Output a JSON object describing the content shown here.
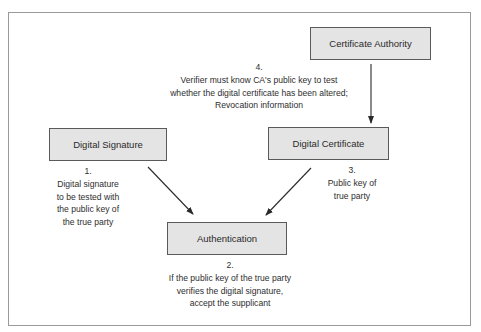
{
  "nodes": {
    "ca": {
      "label": "Certificate Authority"
    },
    "signature": {
      "label": "Digital Signature"
    },
    "certificate": {
      "label": "Digital Certificate"
    },
    "authentication": {
      "label": "Authentication"
    }
  },
  "notes": {
    "n1": {
      "num": "1.",
      "lines": [
        "Digital signature",
        "to be tested with",
        "the public key of",
        "the true party"
      ]
    },
    "n2": {
      "num": "2.",
      "lines": [
        "If the public key of the true party",
        "verifies the digital signature,",
        "accept the supplicant"
      ]
    },
    "n3": {
      "num": "3.",
      "lines": [
        "Public key of",
        "true party"
      ]
    },
    "n4": {
      "num": "4.",
      "lines": [
        "Verifier must know CA's public key to test",
        "whether the digital certificate has been altered;",
        "Revocation information"
      ]
    }
  },
  "edges": [
    {
      "from": "ca",
      "to": "certificate"
    },
    {
      "from": "signature",
      "to": "authentication"
    },
    {
      "from": "certificate",
      "to": "authentication"
    }
  ]
}
